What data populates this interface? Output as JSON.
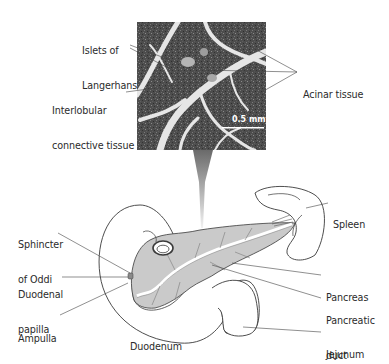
{
  "figure": {
    "micrograph": {
      "scale_bar": "0.5 mm",
      "labels": {
        "islets": [
          "Islets of",
          "Langerhans"
        ],
        "interlobular": [
          "Interlobular",
          "connective tissue"
        ],
        "acinar": [
          "Acinar tissue"
        ]
      }
    },
    "anatomy": {
      "labels": {
        "sphincter": [
          "Sphincter",
          "of Oddi"
        ],
        "papilla": [
          "Duodenal",
          "papilla"
        ],
        "ampulla": [
          "Ampulla"
        ],
        "duodenum": [
          "Duodenum"
        ],
        "spleen": [
          "Spleen"
        ],
        "pancreas": [
          "Pancreas"
        ],
        "pancreatic_duct": [
          "Pancreatic",
          "duct"
        ],
        "jejunum": [
          "Jejunum"
        ]
      }
    },
    "colors": {
      "outline": "#3a3a3a",
      "pancreas_fill": "#c9c9c9",
      "micrograph_dark": "#4a4a4a",
      "micrograph_light": "#e8e8e8",
      "leader_line": "#444444"
    }
  }
}
